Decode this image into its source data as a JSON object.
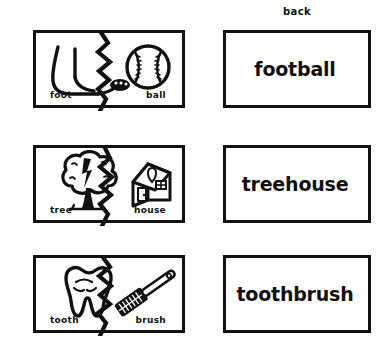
{
  "worksheet": {
    "back_column_label": "back",
    "rows": [
      {
        "left_word": "foot",
        "right_word": "ball",
        "compound": "football",
        "left_icon": "foot-icon",
        "right_icon": "baseball-icon"
      },
      {
        "left_word": "tree",
        "right_word": "house",
        "compound": "treehouse",
        "left_icon": "tree-icon",
        "right_icon": "house-icon"
      },
      {
        "left_word": "tooth",
        "right_word": "brush",
        "compound": "toothbrush",
        "left_icon": "tooth-icon",
        "right_icon": "toothbrush-icon"
      }
    ]
  },
  "colors": {
    "ink": "#111111",
    "paper": "#ffffff"
  }
}
